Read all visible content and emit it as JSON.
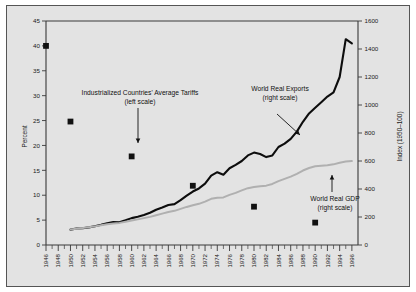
{
  "chart_data": {
    "type": "line",
    "title": "",
    "xlabel": "",
    "ylabel": "Percent",
    "y2label": "Index (1950=100)",
    "xlim": [
      1946,
      1997
    ],
    "ylim": [
      0,
      45
    ],
    "y2lim": [
      0,
      1600
    ],
    "grid": false,
    "legend_position": "inline-annotations",
    "x_ticks": [
      1946,
      1948,
      1950,
      1952,
      1954,
      1956,
      1958,
      1960,
      1962,
      1964,
      1966,
      1968,
      1970,
      1972,
      1974,
      1976,
      1978,
      1980,
      1982,
      1984,
      1986,
      1988,
      1990,
      1992,
      1994,
      1996
    ],
    "x_minor_tick_interval": 1,
    "y_ticks": [
      0,
      5,
      10,
      15,
      20,
      25,
      30,
      35,
      40,
      45
    ],
    "y2_ticks": [
      0,
      200,
      400,
      600,
      800,
      1000,
      1200,
      1400,
      1600
    ],
    "series": [
      {
        "name": "Industrialized Countries' Average Tariffs",
        "scale": "left",
        "units": "Percent",
        "marker": "filled-square",
        "style": "markers-only",
        "x": [
          1946,
          1950,
          1960,
          1970,
          1980,
          1990
        ],
        "values": [
          40.0,
          24.8,
          17.8,
          11.9,
          7.7,
          4.5
        ]
      },
      {
        "name": "World Real Exports",
        "scale": "right",
        "units": "Index (1950=100)",
        "color": "#0d0d0d",
        "style": "line",
        "x": [
          1950,
          1951,
          1952,
          1953,
          1954,
          1955,
          1956,
          1957,
          1958,
          1959,
          1960,
          1961,
          1962,
          1963,
          1964,
          1965,
          1966,
          1967,
          1968,
          1969,
          1970,
          1971,
          1972,
          1973,
          1974,
          1975,
          1976,
          1977,
          1978,
          1979,
          1980,
          1981,
          1982,
          1983,
          1984,
          1985,
          1986,
          1987,
          1988,
          1989,
          1990,
          1991,
          1992,
          1993,
          1994,
          1995,
          1996
        ],
        "values": [
          110,
          118,
          120,
          126,
          134,
          144,
          156,
          164,
          162,
          176,
          192,
          202,
          214,
          230,
          252,
          268,
          286,
          292,
          320,
          352,
          382,
          404,
          438,
          496,
          520,
          502,
          548,
          572,
          600,
          640,
          660,
          650,
          628,
          640,
          700,
          724,
          758,
          810,
          880,
          940,
          980,
          1020,
          1060,
          1090,
          1200,
          1470,
          1440
        ]
      },
      {
        "name": "World Real GDP",
        "scale": "right",
        "units": "Index (1950=100)",
        "color": "#b0b0b0",
        "style": "line",
        "x": [
          1950,
          1951,
          1952,
          1953,
          1954,
          1955,
          1956,
          1957,
          1958,
          1959,
          1960,
          1961,
          1962,
          1963,
          1964,
          1965,
          1966,
          1967,
          1968,
          1969,
          1970,
          1971,
          1972,
          1973,
          1974,
          1975,
          1976,
          1977,
          1978,
          1979,
          1980,
          1981,
          1982,
          1983,
          1984,
          1985,
          1986,
          1987,
          1988,
          1989,
          1990,
          1991,
          1992,
          1993,
          1994,
          1995,
          1996
        ],
        "values": [
          110,
          116,
          121,
          127,
          133,
          141,
          148,
          154,
          158,
          166,
          175,
          183,
          192,
          201,
          213,
          224,
          236,
          244,
          258,
          272,
          284,
          294,
          310,
          330,
          338,
          340,
          358,
          372,
          390,
          406,
          414,
          420,
          424,
          436,
          456,
          472,
          488,
          508,
          532,
          550,
          562,
          566,
          570,
          576,
          588,
          596,
          600
        ]
      }
    ],
    "annotations": [
      {
        "id": "tariffs",
        "line1": "Industrialized Countries' Average Tariffs",
        "line2": "(left scale)"
      },
      {
        "id": "exports",
        "line1": "World Real Exports",
        "line2": "(right scale)"
      },
      {
        "id": "gdp",
        "line1": "World Real GDP",
        "line2": "(right scale)"
      }
    ]
  },
  "axes": {
    "left_title": "Percent",
    "right_title": "Index (1950–100)"
  }
}
